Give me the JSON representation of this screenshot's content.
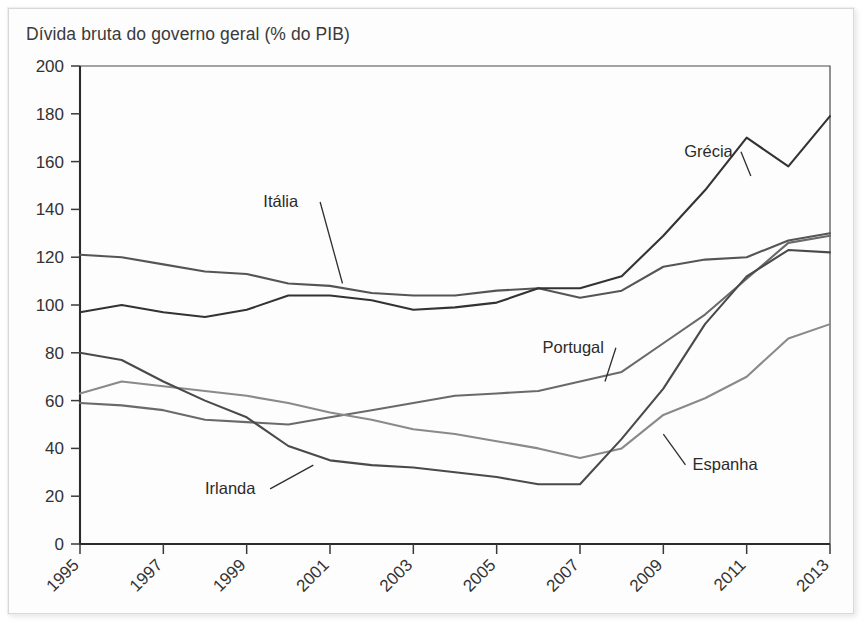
{
  "chart_data": {
    "type": "line",
    "title": "Dívida bruta do governo geral (% do PIB)",
    "xlabel": "",
    "ylabel": "",
    "xlim": [
      1995,
      2013
    ],
    "ylim": [
      0,
      200
    ],
    "ytick_step": 20,
    "xtick_step": 2,
    "grid": false,
    "legend": "inline-callouts",
    "x": [
      1995,
      1996,
      1997,
      1998,
      1999,
      2000,
      2001,
      2002,
      2003,
      2004,
      2005,
      2006,
      2007,
      2008,
      2009,
      2010,
      2011,
      2012,
      2013
    ],
    "yticks": [
      0,
      20,
      40,
      60,
      80,
      100,
      120,
      140,
      160,
      180,
      200
    ],
    "xticks": [
      1995,
      1997,
      1999,
      2001,
      2003,
      2005,
      2007,
      2009,
      2011,
      2013
    ],
    "series": [
      {
        "name": "Itália",
        "color": "#555555",
        "values": [
          121,
          120,
          117,
          114,
          113,
          109,
          108,
          105,
          104,
          104,
          106,
          107,
          103,
          106,
          116,
          119,
          120,
          127,
          130
        ]
      },
      {
        "name": "Grécia",
        "color": "#333333",
        "values": [
          97,
          100,
          97,
          95,
          98,
          104,
          104,
          102,
          98,
          99,
          101,
          107,
          107,
          112,
          129,
          148,
          170,
          158,
          179
        ]
      },
      {
        "name": "Portugal",
        "color": "#6a6a6a",
        "values": [
          59,
          58,
          56,
          52,
          51,
          50,
          53,
          56,
          59,
          62,
          63,
          64,
          68,
          72,
          84,
          96,
          111,
          126,
          129
        ]
      },
      {
        "name": "Espanha",
        "color": "#8a8a8a",
        "values": [
          63,
          68,
          66,
          64,
          62,
          59,
          55,
          52,
          48,
          46,
          43,
          40,
          36,
          40,
          54,
          61,
          70,
          86,
          92
        ]
      },
      {
        "name": "Irlanda",
        "color": "#4a4a4a",
        "values": [
          80,
          77,
          68,
          60,
          53,
          41,
          35,
          33,
          32,
          30,
          28,
          25,
          25,
          44,
          65,
          92,
          112,
          123,
          122
        ]
      }
    ],
    "annotations": [
      {
        "label": "Itália",
        "label_x": 1999.4,
        "label_y": 141,
        "anchor_x": 2001.3,
        "anchor_y": 109
      },
      {
        "label": "Grécia",
        "label_x": 2009.5,
        "label_y": 162,
        "anchor_x": 2011.1,
        "anchor_y": 154
      },
      {
        "label": "Portugal",
        "label_x": 2006.1,
        "label_y": 80,
        "anchor_x": 2007.6,
        "anchor_y": 68
      },
      {
        "label": "Espanha",
        "label_x": 2009.7,
        "label_y": 31,
        "anchor_x": 2009.0,
        "anchor_y": 46
      },
      {
        "label": "Irlanda",
        "label_x": 1998.0,
        "label_y": 21,
        "anchor_x": 2000.6,
        "anchor_y": 33
      }
    ]
  }
}
